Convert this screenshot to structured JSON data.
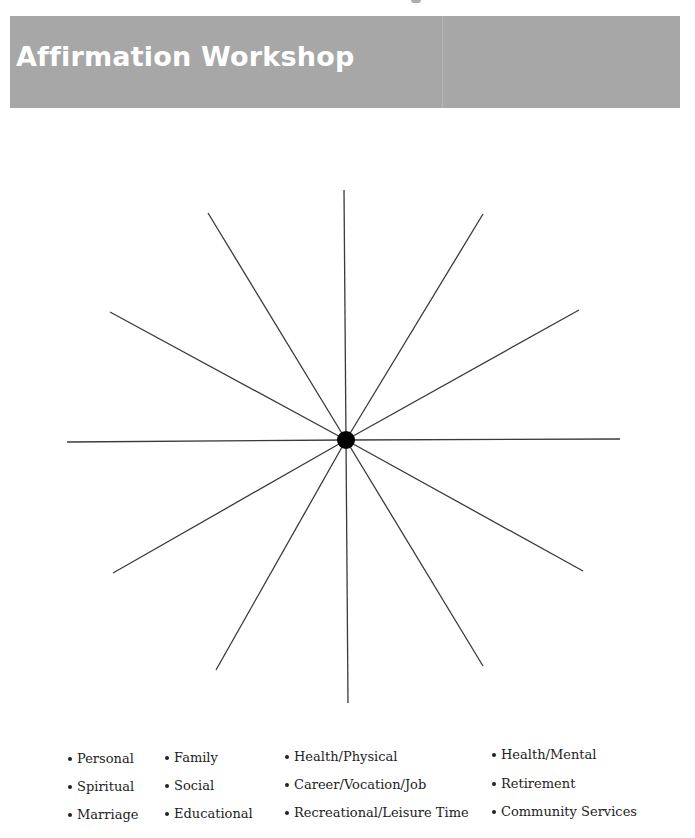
{
  "page": {
    "title": "Affirmation Workshop",
    "banner_color": "#a7a7a7",
    "title_color": "#ffffff"
  },
  "wheel": {
    "center": [
      346,
      440
    ],
    "hub_radius": 9,
    "spoke_count": 12,
    "spokes": [
      {
        "end": [
          344,
          190
        ]
      },
      {
        "end": [
          483,
          214
        ]
      },
      {
        "end": [
          579,
          310
        ]
      },
      {
        "end": [
          620,
          439
        ]
      },
      {
        "end": [
          583,
          571
        ]
      },
      {
        "end": [
          483,
          666
        ]
      },
      {
        "end": [
          348,
          703
        ]
      },
      {
        "end": [
          216,
          670
        ]
      },
      {
        "end": [
          113,
          573
        ]
      },
      {
        "end": [
          67,
          442
        ]
      },
      {
        "end": [
          110,
          312
        ]
      },
      {
        "end": [
          208,
          213
        ]
      }
    ]
  },
  "legend": {
    "columns": [
      {
        "items": [
          "Personal",
          "Spiritual",
          "Marriage"
        ]
      },
      {
        "items": [
          "Family",
          "Social",
          "Educational"
        ]
      },
      {
        "items": [
          "Health/Physical",
          "Career/Vocation/Job",
          "Recreational/Leisure Time"
        ]
      },
      {
        "items": [
          "Health/Mental",
          "Retirement",
          "Community Services"
        ]
      }
    ]
  }
}
